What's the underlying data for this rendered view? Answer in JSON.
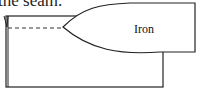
{
  "caption_fragment": "the seam.",
  "iron": {
    "label": "Iron"
  },
  "diagram": {
    "elements": [
      "fabric-rectangle",
      "fold-flap",
      "seam-dashed-line",
      "iron-shape"
    ]
  }
}
